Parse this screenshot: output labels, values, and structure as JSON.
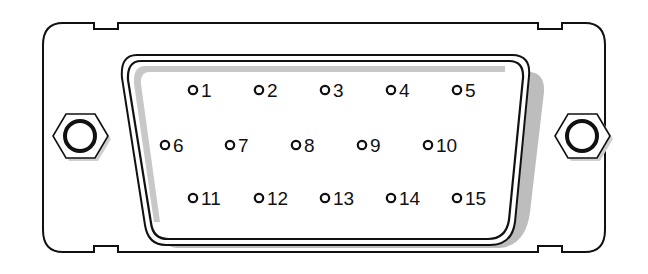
{
  "diagram": {
    "type": "connector-pinout",
    "connector": "DE-15 (15-pin D-sub)",
    "colors": {
      "outline": "#111111",
      "shadow": "#bdbdbd",
      "background": "#ffffff",
      "pin": "#111111"
    },
    "pins": [
      {
        "label": "1",
        "cx": 193,
        "cy": 90
      },
      {
        "label": "2",
        "cx": 259,
        "cy": 90
      },
      {
        "label": "3",
        "cx": 325,
        "cy": 90
      },
      {
        "label": "4",
        "cx": 391,
        "cy": 90
      },
      {
        "label": "5",
        "cx": 457,
        "cy": 90
      },
      {
        "label": "6",
        "cx": 165,
        "cy": 145
      },
      {
        "label": "7",
        "cx": 230,
        "cy": 145
      },
      {
        "label": "8",
        "cx": 296,
        "cy": 145
      },
      {
        "label": "9",
        "cx": 362,
        "cy": 145
      },
      {
        "label": "10",
        "cx": 428,
        "cy": 145
      },
      {
        "label": "11",
        "cx": 193,
        "cy": 198
      },
      {
        "label": "12",
        "cx": 259,
        "cy": 198
      },
      {
        "label": "13",
        "cx": 325,
        "cy": 198
      },
      {
        "label": "14",
        "cx": 391,
        "cy": 198
      },
      {
        "label": "15",
        "cx": 457,
        "cy": 198
      }
    ],
    "hex_nuts": [
      {
        "name": "left",
        "cx": 79,
        "cy": 136
      },
      {
        "name": "right",
        "cx": 583,
        "cy": 136
      }
    ]
  }
}
